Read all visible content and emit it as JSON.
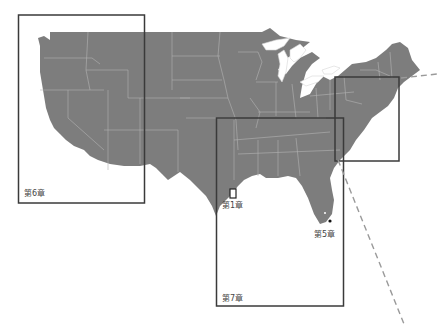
{
  "map": {
    "type": "region-index-map",
    "land_color": "#7d7d7d",
    "border_color": "#b4b4b4",
    "frame_color": "#3a3a3a",
    "dash_color": "#9a9a9a"
  },
  "regions": [
    {
      "id": "ch6",
      "label": "第6章"
    },
    {
      "id": "ch1",
      "label": "第1章"
    },
    {
      "id": "ch5",
      "label": "第5章"
    },
    {
      "id": "ch7",
      "label": "第7章"
    }
  ]
}
